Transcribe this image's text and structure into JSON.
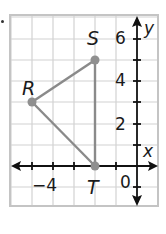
{
  "figure": {
    "type": "coordinate-plane",
    "x_axis_label": "x",
    "y_axis_label": "y",
    "x_tick_labels": [
      {
        "value": -4,
        "text": "−4"
      },
      {
        "value": 0,
        "text": "0"
      }
    ],
    "y_tick_labels": [
      {
        "value": 2,
        "text": "2"
      },
      {
        "value": 4,
        "text": "4"
      },
      {
        "value": 6,
        "text": "6"
      }
    ],
    "grid": {
      "x_min": -6,
      "x_max": 1,
      "y_min": -2,
      "y_max": 7,
      "step": 1
    },
    "points": [
      {
        "name": "R",
        "label": "R",
        "x": -5,
        "y": 3
      },
      {
        "name": "S",
        "label": "S",
        "x": -2,
        "y": 5
      },
      {
        "name": "T",
        "label": "T",
        "x": -2,
        "y": 0
      }
    ],
    "segments": [
      [
        "R",
        "S"
      ],
      [
        "S",
        "T"
      ],
      [
        "T",
        "R"
      ]
    ],
    "colors": {
      "grid": "#cfcfcf",
      "frame": "#c8c8c8",
      "axis": "#111111",
      "triangle": "#8a8a8a",
      "point": "#8f8f8f"
    }
  }
}
